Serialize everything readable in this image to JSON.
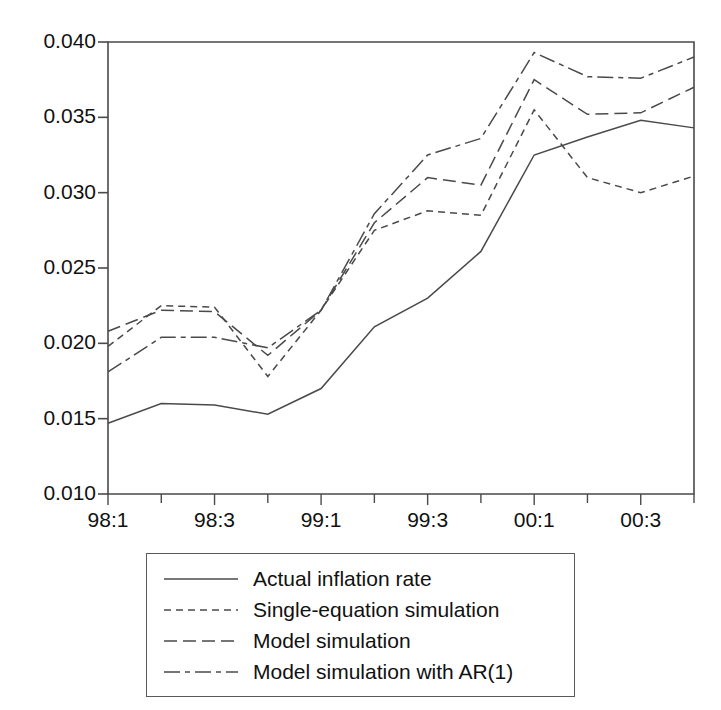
{
  "chart_data": {
    "type": "line",
    "title": "",
    "subtitle": "",
    "xlabel": "",
    "ylabel": "",
    "grid": false,
    "legend_position": "below-center",
    "x": [
      "98:1",
      "98:2",
      "98:3",
      "98:4",
      "99:1",
      "99:2",
      "99:3",
      "99:4",
      "00:1",
      "00:2",
      "00:3",
      "00:4"
    ],
    "categories": [
      "98:1",
      "98:2",
      "98:3",
      "98:4",
      "99:1",
      "99:2",
      "99:3",
      "99:4",
      "00:1",
      "00:2",
      "00:3",
      "00:4"
    ],
    "xtick_labels": [
      "98:1",
      "98:3",
      "99:1",
      "99:3",
      "00:1",
      "00:3"
    ],
    "xtick_indices": [
      0,
      2,
      4,
      6,
      8,
      10
    ],
    "ytick_labels": [
      "0.010",
      "0.015",
      "0.020",
      "0.025",
      "0.030",
      "0.035",
      "0.040"
    ],
    "ytick_values": [
      0.01,
      0.015,
      0.02,
      0.025,
      0.03,
      0.035,
      0.04
    ],
    "ylim": [
      0.01,
      0.04
    ],
    "xlim_index": [
      0,
      11
    ],
    "series": [
      {
        "name": "Actual inflation rate",
        "style": "solid",
        "color": "#4a4a4a",
        "values": [
          0.0147,
          0.016,
          0.0159,
          0.0153,
          0.017,
          0.0211,
          0.023,
          0.0261,
          0.0325,
          0.0337,
          0.0348,
          0.0343
        ]
      },
      {
        "name": "Single-equation simulation",
        "style": "dotted",
        "color": "#4a4a4a",
        "values": [
          0.0198,
          0.0225,
          0.0224,
          0.0178,
          0.0222,
          0.0275,
          0.0288,
          0.0285,
          0.0355,
          0.031,
          0.03,
          0.0311
        ]
      },
      {
        "name": "Model simulation",
        "style": "dashed",
        "color": "#4a4a4a",
        "values": [
          0.0208,
          0.0222,
          0.0221,
          0.0192,
          0.0222,
          0.028,
          0.031,
          0.0305,
          0.0375,
          0.0352,
          0.0353,
          0.037
        ]
      },
      {
        "name": "Model simulation with AR(1)",
        "style": "dashdot",
        "color": "#4a4a4a",
        "values": [
          0.0181,
          0.0204,
          0.0204,
          0.0197,
          0.0222,
          0.0286,
          0.0325,
          0.0336,
          0.0393,
          0.0377,
          0.0376,
          0.039
        ]
      }
    ]
  },
  "axes": {
    "plot_left_px": 108,
    "plot_right_px": 694,
    "plot_top_px": 42,
    "plot_bottom_px": 494
  },
  "legend": {
    "items": [
      {
        "label": "Actual inflation rate",
        "style": "solid"
      },
      {
        "label": "Single-equation simulation",
        "style": "dotted"
      },
      {
        "label": "Model simulation",
        "style": "dashed"
      },
      {
        "label": "Model simulation with AR(1)",
        "style": "dashdot"
      }
    ]
  },
  "colors": {
    "axis": "#4a4a4a",
    "line": "#4a4a4a",
    "text": "#111111",
    "background": "#ffffff",
    "legend_border": "#5a5a5a"
  }
}
